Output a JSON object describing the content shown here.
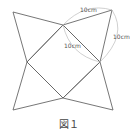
{
  "diagram": {
    "caption": "図１",
    "labels": {
      "top_edge": "10cm",
      "right_edge": "10cm",
      "inner_edge": "10cm"
    },
    "colors": {
      "line": "#666666",
      "arc": "#bbbbbb",
      "text": "#555555"
    }
  }
}
